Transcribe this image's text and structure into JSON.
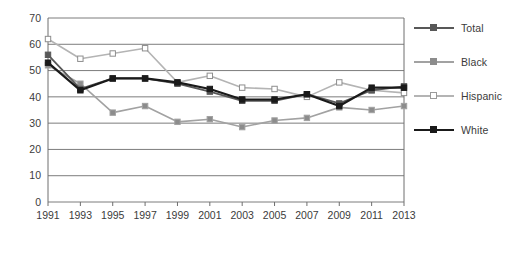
{
  "chart_data": {
    "type": "line",
    "title": "",
    "subtitle": "",
    "xlabel": "",
    "ylabel": "",
    "x": [
      1991,
      1993,
      1995,
      1997,
      1999,
      2001,
      2003,
      2005,
      2007,
      2009,
      2011,
      2013
    ],
    "xtick_labels": [
      "1991",
      "1993",
      "1995",
      "1997",
      "1999",
      "2001",
      "2003",
      "2005",
      "2007",
      "2009",
      "2011",
      "2013"
    ],
    "ytick_labels": [
      "0",
      "10",
      "20",
      "30",
      "40",
      "50",
      "60",
      "70"
    ],
    "yticks": [
      0,
      10,
      20,
      30,
      40,
      50,
      60,
      70
    ],
    "ylim": [
      0,
      70
    ],
    "grid": "horizontal",
    "legend_position": "right",
    "series": [
      {
        "name": "Total",
        "color": "#585858",
        "marker": "filled-square",
        "marker_fill": "#585858",
        "line_width": 1.8,
        "values": [
          56,
          43,
          47,
          47,
          45,
          42,
          38.5,
          38.5,
          41,
          37.5,
          42.5,
          44
        ]
      },
      {
        "name": "Black",
        "color": "#a2a2a2",
        "marker": "filled-square",
        "marker_fill": "#8c8c8c",
        "line_width": 1.6,
        "values": [
          52,
          45,
          34,
          36.5,
          30.5,
          31.5,
          28.5,
          31,
          32,
          36,
          35,
          36.5
        ]
      },
      {
        "name": "Hispanic",
        "color": "#b4b4b4",
        "marker": "open-square",
        "marker_fill": "#ffffff",
        "line_width": 1.6,
        "values": [
          62,
          54.5,
          56.5,
          58.5,
          45.5,
          48,
          43.5,
          43,
          40,
          45.5,
          42.5,
          41.5
        ]
      },
      {
        "name": "White",
        "color": "#1a1a1a",
        "marker": "filled-square",
        "marker_fill": "#1a1a1a",
        "line_width": 2.2,
        "values": [
          53,
          42.5,
          47,
          47,
          45.5,
          43,
          39,
          39,
          41,
          36.5,
          43.5,
          43.5
        ]
      }
    ]
  },
  "legend": {
    "items": [
      {
        "label": "Total"
      },
      {
        "label": "Black"
      },
      {
        "label": "Hispanic"
      },
      {
        "label": "White"
      }
    ]
  },
  "axes": {
    "plot_border_color": "#6e6e6e",
    "grid_color": "#6e6e6e",
    "tick_color": "#6e6e6e"
  }
}
